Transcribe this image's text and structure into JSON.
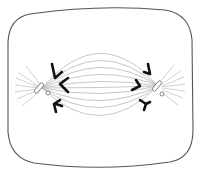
{
  "diagram": {
    "colors": {
      "background": "#ffffff",
      "cell_outline": "#555555",
      "spindle_fiber": "#b8b8b8",
      "aster_ray": "#c4c4c4",
      "chromosome": "#111111",
      "centriole": "#777777"
    },
    "parts": {
      "cell_membrane": "cell-membrane",
      "spindle": "spindle-fibers",
      "left_pole": "left-centrosome",
      "right_pole": "right-centrosome",
      "chromosomes": "chromosomes"
    }
  }
}
